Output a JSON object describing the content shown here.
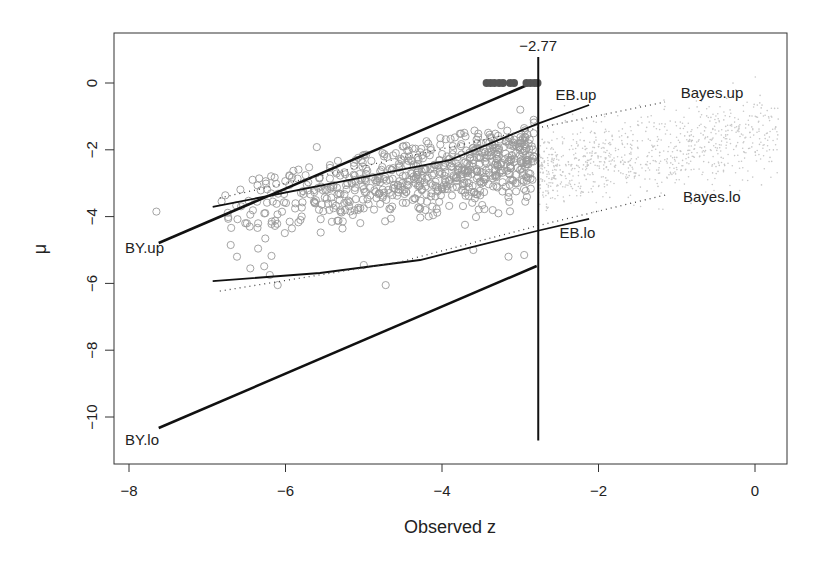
{
  "chart_data": {
    "type": "scatter",
    "title": "",
    "xlabel": "Observed z",
    "ylabel": "μ",
    "xlim": [
      -8.15,
      0.4
    ],
    "ylim": [
      -11.4,
      1.5
    ],
    "grid": false,
    "legend": "none (inline line labels)",
    "x_ticks": [
      -8,
      -6,
      -4,
      -2,
      0
    ],
    "x_tick_labels": [
      "−8",
      "−6",
      "−4",
      "−2",
      "0"
    ],
    "y_ticks": [
      0,
      -2,
      -4,
      -6,
      -8,
      -10
    ],
    "y_tick_labels": [
      "0",
      "−2",
      "−4",
      "−6",
      "−8",
      "−10"
    ],
    "threshold": {
      "z": -2.77,
      "label": "−2.77",
      "y_from": -10.7,
      "y_to": 0.78
    },
    "lines": [
      {
        "name": "BY.up",
        "style": "solid-thick",
        "points": [
          [
            -7.62,
            -4.79
          ],
          [
            -2.88,
            -0.03
          ]
        ],
        "label_pos": [
          -8.05,
          -5.1
        ]
      },
      {
        "name": "BY.lo",
        "style": "solid-thick",
        "points": [
          [
            -7.62,
            -10.33
          ],
          [
            -2.79,
            -5.48
          ]
        ],
        "label_pos": [
          -8.05,
          -10.85
        ]
      },
      {
        "name": "EB.up",
        "style": "solid",
        "points": [
          [
            -6.93,
            -3.71
          ],
          [
            -5.18,
            -2.9
          ],
          [
            -3.9,
            -2.31
          ],
          [
            -2.79,
            -1.23
          ],
          [
            -2.12,
            -0.66
          ]
        ],
        "label_pos": [
          -2.55,
          -0.5
        ]
      },
      {
        "name": "EB.lo",
        "style": "solid",
        "points": [
          [
            -6.93,
            -5.93
          ],
          [
            -5.56,
            -5.69
          ],
          [
            -4.28,
            -5.3
          ],
          [
            -2.79,
            -4.43
          ],
          [
            -2.12,
            -4.07
          ]
        ],
        "label_pos": [
          -2.5,
          -4.65
        ]
      },
      {
        "name": "Bayes.up",
        "style": "dotted",
        "points": [
          [
            -6.84,
            -3.44
          ],
          [
            -2.79,
            -1.35
          ],
          [
            -1.15,
            -0.57
          ]
        ],
        "label_pos": [
          -0.95,
          -0.45
        ]
      },
      {
        "name": "Bayes.lo",
        "style": "dotted",
        "points": [
          [
            -6.84,
            -6.23
          ],
          [
            -4.54,
            -5.36
          ],
          [
            -2.79,
            -4.28
          ],
          [
            -1.14,
            -3.35
          ]
        ],
        "label_pos": [
          -0.92,
          -3.55
        ]
      }
    ],
    "selected_points": {
      "description": "filled dark points at mu = 0 for z <= -2.77",
      "color": "#555555",
      "z": [
        -3.43,
        -3.38,
        -3.33,
        -3.27,
        -3.22,
        -3.13,
        -3.08,
        -2.92,
        -2.87,
        -2.82,
        -2.78
      ],
      "mu": 0
    },
    "open_circles": {
      "description": "observed (z, mu) pairs with z < -2.77, gray open circles",
      "color": "#9a9a9a",
      "count": 700,
      "z_range": [
        -7.65,
        -2.77
      ],
      "explicit_points": [
        [
          -7.65,
          -3.85
        ],
        [
          -5.6,
          -1.92
        ],
        [
          -6.7,
          -4.85
        ],
        [
          -6.62,
          -5.2
        ],
        [
          -6.45,
          -5.55
        ],
        [
          -6.35,
          -4.2
        ],
        [
          -6.2,
          -5.75
        ],
        [
          -6.1,
          -6.05
        ],
        [
          -4.72,
          -6.05
        ],
        [
          -3.15,
          -5.2
        ],
        [
          -2.95,
          -5.15
        ],
        [
          -3.0,
          -0.8
        ],
        [
          -2.95,
          -1.35
        ],
        [
          -3.15,
          -1.75
        ],
        [
          -3.7,
          -1.6
        ],
        [
          -4.3,
          -2.3
        ],
        [
          -5.0,
          -5.45
        ],
        [
          -3.6,
          -5.0
        ]
      ],
      "trend": {
        "intercept": -1.15,
        "slope": 0.4,
        "spread_sd": 0.55
      }
    },
    "null_cloud": {
      "description": "light gray small dots for z > -2.77 (remaining cases)",
      "color": "#c8c8c8",
      "count": 900,
      "z_range": [
        -2.77,
        0.3
      ]
    }
  }
}
